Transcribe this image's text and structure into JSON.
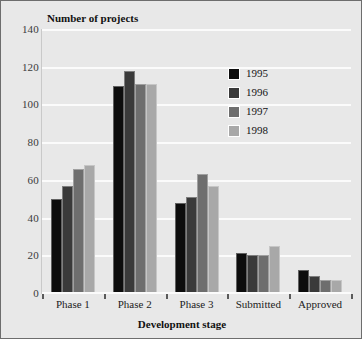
{
  "chart_data": {
    "type": "bar",
    "title": "",
    "xlabel": "Development stage",
    "ylabel": "Number of projects",
    "categories": [
      "Phase 1",
      "Phase 2",
      "Phase 3",
      "Submitted",
      "Approved"
    ],
    "series": [
      {
        "name": "1995",
        "color": "#0d0d0d",
        "values": [
          50,
          110,
          48,
          21,
          12
        ]
      },
      {
        "name": "1996",
        "color": "#3a3a3a",
        "values": [
          57,
          118,
          51,
          20,
          9
        ]
      },
      {
        "name": "1997",
        "color": "#6e6e6e",
        "values": [
          66,
          111,
          63,
          20,
          7
        ]
      },
      {
        "name": "1998",
        "color": "#a8a8a8",
        "values": [
          68,
          111,
          57,
          25,
          7
        ]
      }
    ],
    "yticks": [
      0,
      20,
      40,
      60,
      80,
      100,
      120,
      140
    ],
    "ylim": [
      0,
      140
    ],
    "grid": true,
    "legend_position": "upper-right",
    "legend_entries": [
      "1995",
      "1996",
      "1997",
      "1998"
    ]
  },
  "colors": {
    "background": "#e8e8e8",
    "gridline": "#fbfbfb",
    "border": "#6d6d6d",
    "text": "#111111"
  }
}
